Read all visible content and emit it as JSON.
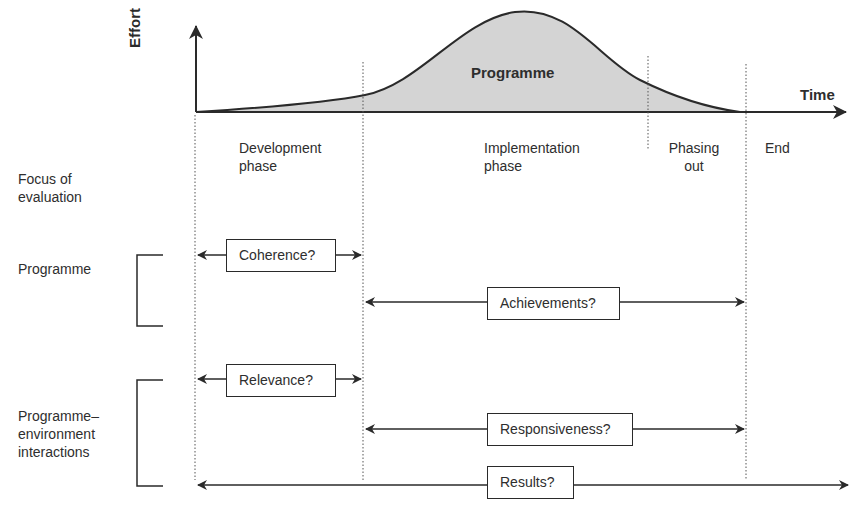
{
  "axes": {
    "y_label": "Effort",
    "x_label": "Time"
  },
  "curve": {
    "label": "Programme",
    "fill": "#d4d4d4",
    "stroke": "#2a2a2a"
  },
  "phases": [
    {
      "line1": "Development",
      "line2": "phase"
    },
    {
      "line1": "Implementation",
      "line2": "phase"
    },
    {
      "line1": "Phasing",
      "line2": "out"
    },
    {
      "line1": "End",
      "line2": ""
    }
  ],
  "focus": {
    "heading_line1": "Focus of",
    "heading_line2": "evaluation",
    "groups": [
      {
        "label_line1": "Programme",
        "label_line2": "",
        "label_line3": ""
      },
      {
        "label_line1": "Programme–",
        "label_line2": "environment",
        "label_line3": "interactions"
      }
    ]
  },
  "questions": {
    "coherence": "Coherence?",
    "achievements": "Achievements?",
    "relevance": "Relevance?",
    "responsiveness": "Responsiveness?",
    "results": "Results?"
  }
}
